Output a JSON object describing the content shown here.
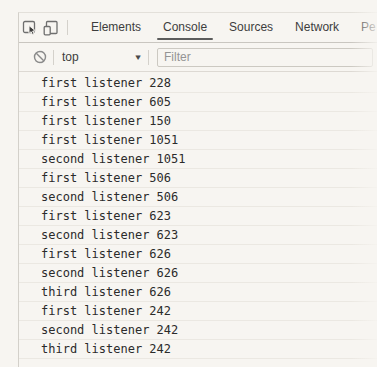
{
  "tabbar": {
    "tabs": [
      {
        "label": "Elements",
        "active": false
      },
      {
        "label": "Console",
        "active": true
      },
      {
        "label": "Sources",
        "active": false
      },
      {
        "label": "Network",
        "active": false
      },
      {
        "label": "Pe",
        "active": false
      }
    ]
  },
  "toolbar": {
    "context": "top",
    "filter_placeholder": "Filter",
    "filter_value": ""
  },
  "icons": {
    "inspect": "inspect-element",
    "device": "toggle-device-toolbar",
    "clear_console": "block-circle",
    "dropdown_arrow": "▼"
  },
  "console": {
    "messages": [
      "first listener 228",
      "first listener 605",
      "first listener 150",
      "first listener 1051",
      "second listener 1051",
      "first listener 506",
      "second listener 506",
      "first listener 623",
      "second listener 623",
      "first listener 626",
      "second listener 626",
      "third listener 626",
      "first listener 242",
      "second listener 242",
      "third listener 242"
    ]
  },
  "colors": {
    "background": "#f7f5f1",
    "tab_underline": "#5c5c5c",
    "console_text": "#2b2b2b",
    "toolbar_border": "#c9c6c0",
    "icon_gray": "#6f6f6f",
    "clear_icon_gray": "#8a8a8a",
    "placeholder": "#949494"
  }
}
